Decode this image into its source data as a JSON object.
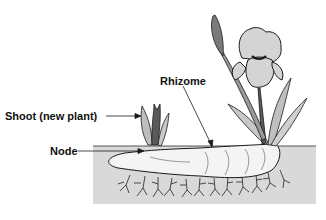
{
  "diagram": {
    "labels": {
      "rhizome": "Rhizome",
      "shoot": "Shoot (new plant)",
      "node": "Node"
    },
    "colors": {
      "soil": "#d9d9d9",
      "rhizome": "#f4f4f4",
      "flower": "#d4d4d4",
      "leaf": "#bfbfbf",
      "outline": "#1a1a1a"
    }
  }
}
